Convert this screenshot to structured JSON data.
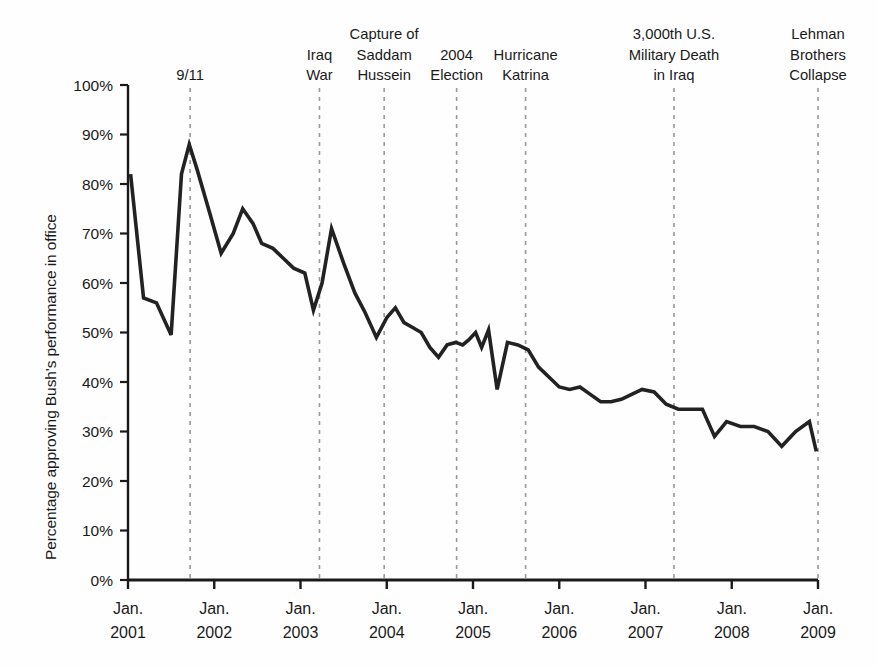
{
  "chart_data": {
    "type": "line",
    "title": "",
    "subtitle": "",
    "xlabel": "",
    "ylabel": "Percentage approving Bush's performance in office",
    "ylim": [
      0,
      100
    ],
    "xlim": [
      2001.0,
      2009.0
    ],
    "grid": false,
    "legend": null,
    "y_ticks": [
      "0%",
      "10%",
      "20%",
      "30%",
      "40%",
      "50%",
      "60%",
      "70%",
      "80%",
      "90%",
      "100%"
    ],
    "y_tick_values": [
      0,
      10,
      20,
      30,
      40,
      50,
      60,
      70,
      80,
      90,
      100
    ],
    "x_ticks": [
      {
        "line1": "Jan.",
        "line2": "2001",
        "value": 2001
      },
      {
        "line1": "Jan.",
        "line2": "2002",
        "value": 2002
      },
      {
        "line1": "Jan.",
        "line2": "2003",
        "value": 2003
      },
      {
        "line1": "Jan.",
        "line2": "2004",
        "value": 2004
      },
      {
        "line1": "Jan.",
        "line2": "2005",
        "value": 2005
      },
      {
        "line1": "Jan.",
        "line2": "2006",
        "value": 2006
      },
      {
        "line1": "Jan.",
        "line2": "2007",
        "value": 2007
      },
      {
        "line1": "Jan.",
        "line2": "2008",
        "value": 2008
      },
      {
        "line1": "Jan.",
        "line2": "2009",
        "value": 2009
      }
    ],
    "series": [
      {
        "name": "Presidential approval rating",
        "color": "#222222",
        "x": [
          2001.03,
          2001.18,
          2001.33,
          2001.5,
          2001.62,
          2001.71,
          2001.8,
          2001.95,
          2002.08,
          2002.22,
          2002.33,
          2002.45,
          2002.55,
          2002.68,
          2002.8,
          2002.92,
          2003.05,
          2003.15,
          2003.25,
          2003.36,
          2003.5,
          2003.63,
          2003.75,
          2003.88,
          2004.0,
          2004.1,
          2004.2,
          2004.3,
          2004.4,
          2004.5,
          2004.6,
          2004.7,
          2004.8,
          2004.88,
          2004.95,
          2005.03,
          2005.1,
          2005.18,
          2005.28,
          2005.4,
          2005.52,
          2005.64,
          2005.76,
          2005.88,
          2006.0,
          2006.12,
          2006.24,
          2006.36,
          2006.48,
          2006.6,
          2006.72,
          2006.84,
          2006.96,
          2007.1,
          2007.24,
          2007.38,
          2007.52,
          2007.66,
          2007.8,
          2007.94,
          2008.1,
          2008.26,
          2008.42,
          2008.58,
          2008.74,
          2008.9,
          2008.98
        ],
        "y": [
          82,
          57,
          56,
          49.5,
          82,
          88,
          83,
          74,
          66,
          70,
          75,
          72,
          68,
          67,
          65,
          63,
          62,
          54.5,
          60,
          71,
          64,
          58,
          54,
          49,
          53,
          55,
          52,
          51,
          50,
          47,
          45,
          47.5,
          48,
          47.5,
          48.5,
          50,
          47,
          50.5,
          38.5,
          48,
          47.5,
          46.5,
          43,
          41,
          39,
          38.5,
          39,
          37.5,
          36,
          36,
          36.5,
          37.5,
          38.5,
          38,
          35.5,
          34.5,
          34.5,
          34.5,
          29,
          32,
          31,
          31,
          30,
          27,
          30,
          32,
          26
        ]
      }
    ],
    "annotations": [
      {
        "id": "nine-eleven",
        "label_lines": [
          "9/11"
        ],
        "x": 2001.72,
        "align": "middle"
      },
      {
        "id": "iraq-war",
        "label_lines": [
          "Iraq",
          "War"
        ],
        "x": 2003.22,
        "align": "middle"
      },
      {
        "id": "capture-saddam",
        "label_lines": [
          "Capture of",
          "Saddam",
          "Hussein"
        ],
        "x": 2003.97,
        "align": "middle"
      },
      {
        "id": "election-2004",
        "label_lines": [
          "2004",
          "Election"
        ],
        "x": 2004.81,
        "align": "middle"
      },
      {
        "id": "hurricane-katrina",
        "label_lines": [
          "Hurricane",
          "Katrina"
        ],
        "x": 2005.61,
        "align": "middle"
      },
      {
        "id": "military-death",
        "label_lines": [
          "3,000th U.S.",
          "Military Death",
          "in Iraq"
        ],
        "x": 2007.33,
        "align": "middle"
      },
      {
        "id": "lehman-collapse",
        "label_lines": [
          "Lehman",
          "Brothers",
          "Collapse"
        ],
        "x": 2009.0,
        "align": "middle"
      }
    ],
    "styles": {
      "line_color": "#222222",
      "line_width": 3.6,
      "axis_color": "#1a1a1a",
      "annotation_line_color": "#9a9a9a",
      "background": "#fefefe"
    }
  }
}
